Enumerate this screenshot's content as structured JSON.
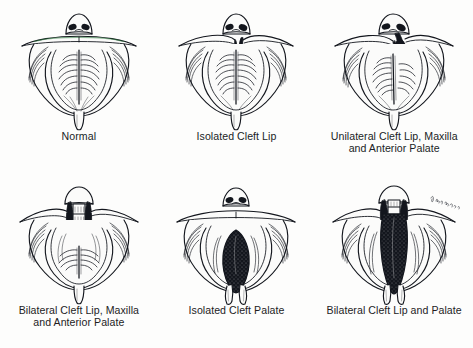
{
  "figure": {
    "view_description": "Inferior (intraoral) view of nose, upper lip, maxilla, palate and uvula",
    "background_color": "#fdfdfc",
    "ink_color": "#13161d",
    "caption_color_row1": "#1a1d26",
    "caption_color_row2": "#231c1e",
    "cleft_fill_color": "#13161d",
    "tissue_fill_color": "#fbfbfa",
    "columns": 3,
    "rows": 2,
    "artist_signature": "artist-signature-cursive"
  },
  "panels": [
    {
      "id": "normal",
      "caption": "Normal",
      "row": 1,
      "column": 1,
      "cleft_type": "none",
      "lip_intact": true,
      "palate_intact": true,
      "uvula": "single",
      "premaxilla": "intact",
      "clefts": []
    },
    {
      "id": "isolated-cleft-lip",
      "caption": "Isolated Cleft Lip",
      "row": 1,
      "column": 2,
      "cleft_type": "lip-only",
      "lip_intact": false,
      "palate_intact": true,
      "uvula": "single",
      "premaxilla": "intact",
      "clefts": [
        "unilateral-lip-notch"
      ]
    },
    {
      "id": "unilateral-cleft-lip-maxilla-anterior-palate",
      "caption": "Unilateral Cleft Lip, Maxilla\nand Anterior Palate",
      "row": 1,
      "column": 3,
      "cleft_type": "unilateral-lip-maxilla-anterior-palate",
      "lip_intact": false,
      "palate_intact": false,
      "uvula": "single",
      "premaxilla": "deviated",
      "clefts": [
        "unilateral-right-paramedian"
      ]
    },
    {
      "id": "bilateral-cleft-lip-maxilla-anterior-palate",
      "caption": "Bilateral Cleft Lip, Maxilla\nand Anterior Palate",
      "row": 2,
      "column": 1,
      "cleft_type": "bilateral-lip-maxilla-anterior-palate",
      "lip_intact": false,
      "palate_intact": false,
      "uvula": "single",
      "premaxilla": "isolated-central-segment",
      "clefts": [
        "left-paramedian",
        "right-paramedian"
      ]
    },
    {
      "id": "isolated-cleft-palate",
      "caption": "Isolated Cleft Palate",
      "row": 2,
      "column": 2,
      "cleft_type": "palate-only",
      "lip_intact": true,
      "palate_intact": false,
      "uvula": "bifid",
      "premaxilla": "intact",
      "clefts": [
        "midline-palatal"
      ]
    },
    {
      "id": "bilateral-cleft-lip-and-palate",
      "caption": "Bilateral Cleft Lip and Palate",
      "row": 2,
      "column": 3,
      "cleft_type": "bilateral-lip-and-palate",
      "lip_intact": false,
      "palate_intact": false,
      "uvula": "bifid",
      "premaxilla": "protruding-central-segment",
      "clefts": [
        "left-complete",
        "right-complete",
        "midline-palatal"
      ]
    }
  ]
}
